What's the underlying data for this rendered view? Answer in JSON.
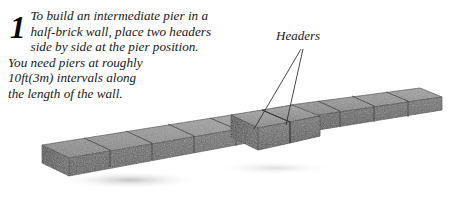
{
  "page": {
    "background_color": "#ffffff",
    "width": 451,
    "height": 198
  },
  "instruction": {
    "step_number": "1",
    "lines": [
      "To build an intermediate pier in a",
      "half-brick wall, place two headers",
      "side by side at the pier position.",
      "You need piers at roughly",
      "10ft(3m) intervals along",
      "the length of the wall."
    ],
    "full_text": "To build an intermediate pier in a half-brick wall, place two headers side by side at the pier position. You need piers at roughly 10ft(3m) intervals along the length of the wall."
  },
  "callout": {
    "label": "Headers",
    "leader_lines": 2
  },
  "illustration": {
    "subject": "half-brick wall with intermediate pier",
    "brick_colors": {
      "top_face": "#8e8e8e",
      "front_face": "#6a6a6a",
      "end_face": "#4f4f4f",
      "joint_line": "#3a3a3a",
      "outline": "#2e2e2e",
      "shadow": "#cfcfcf"
    }
  }
}
